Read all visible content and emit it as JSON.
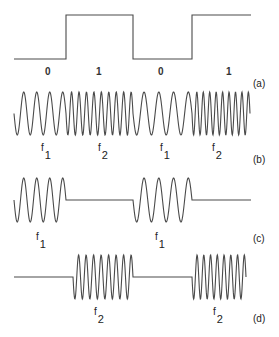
{
  "figure": {
    "panels": [
      {
        "id": "a",
        "label": "(a)",
        "kind": "digital-signal",
        "bits": [
          "0",
          "1",
          "0",
          "1"
        ]
      },
      {
        "id": "b",
        "label": "(b)",
        "kind": "FSK",
        "segments": [
          {
            "freq_label": "f",
            "freq_sub": "1"
          },
          {
            "freq_label": "f",
            "freq_sub": "2"
          },
          {
            "freq_label": "f",
            "freq_sub": "1"
          },
          {
            "freq_label": "f",
            "freq_sub": "2"
          }
        ]
      },
      {
        "id": "c",
        "label": "(c)",
        "kind": "OOK-f1",
        "segments": [
          {
            "freq_label": "f",
            "freq_sub": "1"
          },
          {
            "freq_label": "f",
            "freq_sub": "1"
          }
        ]
      },
      {
        "id": "d",
        "label": "(d)",
        "kind": "OOK-f2",
        "segments": [
          {
            "freq_label": "f",
            "freq_sub": "2"
          },
          {
            "freq_label": "f",
            "freq_sub": "2"
          }
        ]
      }
    ],
    "colors": {
      "stroke": "#4a4a4a",
      "text": "#222222",
      "background": "#ffffff"
    }
  }
}
